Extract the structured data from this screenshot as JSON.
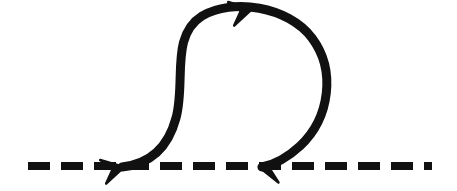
{
  "figure": {
    "title": "Looping trajectory over dashed baseline",
    "width": 457,
    "height": 191,
    "background_color": "#ffffff",
    "stroke_color": "#111111",
    "stroke_width": 9
  },
  "baseline": {
    "name": "dashed-baseline",
    "y": 166,
    "x_start": 28,
    "x_end": 432,
    "dash_length": 22,
    "gap_length": 11,
    "thickness": 8,
    "color": "#111111",
    "style": "dashed"
  },
  "curve": {
    "name": "loop-curve",
    "color": "#111111",
    "thickness": 9,
    "path": "M 122 167 C 150 164, 168 148, 176 118 C 186 82, 170 36, 202 16 C 232 -2, 288 6, 312 38 C 336 70, 330 118, 300 146 C 286 159, 272 165, 262 167",
    "loop_top_y": 7,
    "loop_left_x": 172,
    "loop_right_x": 326,
    "direction": "clockwise"
  },
  "arrowheads": [
    {
      "name": "arrowhead-left-baseline",
      "x": 124,
      "y": 167,
      "angle_deg": -12,
      "direction": "right",
      "size": 19
    },
    {
      "name": "arrowhead-loop-top",
      "x": 252,
      "y": 9,
      "angle_deg": -12,
      "direction": "right",
      "size": 19
    },
    {
      "name": "arrowhead-right-baseline",
      "x": 259,
      "y": 167,
      "angle_deg": 190,
      "direction": "left",
      "size": 19
    }
  ]
}
